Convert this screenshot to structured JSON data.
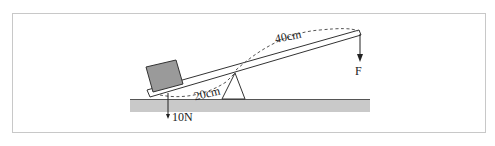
{
  "diagram": {
    "type": "lever",
    "labels": {
      "long_arm": "40cm",
      "short_arm": "20cm",
      "weight": "10N",
      "force": "F"
    },
    "colors": {
      "frame": "#c8c8c8",
      "ground": "#c9c9c9",
      "block": "#9a9a9a",
      "stroke": "#333333"
    }
  }
}
